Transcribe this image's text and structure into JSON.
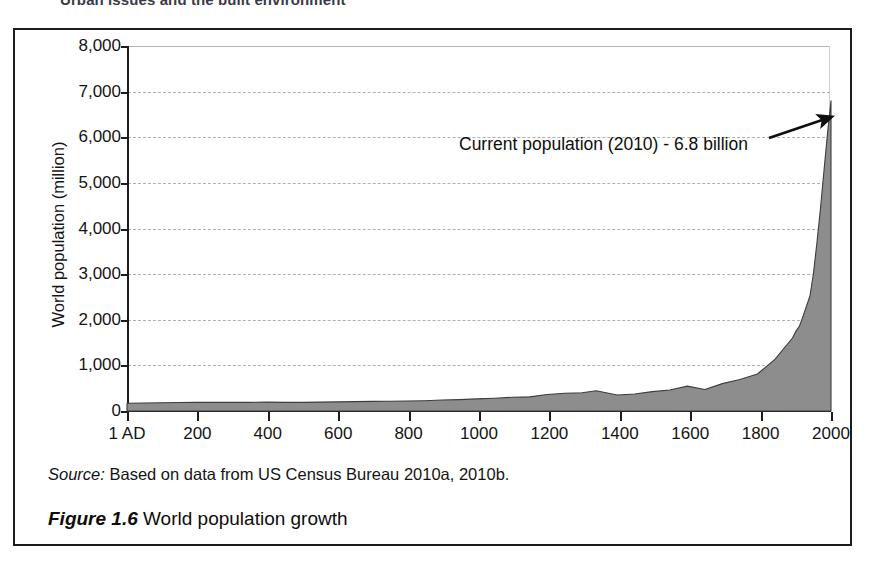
{
  "running_head": "Urban issues and the built environment",
  "figure": {
    "caption_number": "Figure 1.6",
    "caption_text": "World population growth",
    "source_lead": "Source:",
    "source_text": "Based on data from US Census Bureau 2010a, 2010b."
  },
  "annotation": {
    "text": "Current population (2010) - 6.8 billion"
  },
  "colors": {
    "area_fill": "#8d8d8d",
    "area_stroke": "#3d3d3d",
    "axis": "#1c1c1c",
    "grid": "#b0b0b0",
    "frame": "#1c1c1c",
    "text": "#141414"
  },
  "chart_data": {
    "type": "area",
    "title": "World population growth",
    "xlabel": "",
    "ylabel": "World population (million)",
    "xlim": [
      1,
      2010
    ],
    "ylim": [
      0,
      8000
    ],
    "grid": true,
    "legend": "none",
    "ytick_labels": [
      "8,000",
      "7,000",
      "6,000",
      "5,000",
      "4,000",
      "3,000",
      "2,000",
      "1,000",
      "0"
    ],
    "ytick_values": [
      8000,
      7000,
      6000,
      5000,
      4000,
      3000,
      2000,
      1000,
      0
    ],
    "xtick_labels": [
      "1 AD",
      "200",
      "400",
      "600",
      "800",
      "1000",
      "1200",
      "1400",
      "1600",
      "1800",
      "2000"
    ],
    "xtick_values": [
      1,
      200,
      400,
      600,
      800,
      1000,
      1200,
      1400,
      1600,
      1800,
      2000
    ],
    "annotations": [
      {
        "text": "Current population (2010) - 6.8 billion",
        "x": 2010,
        "y": 6800
      }
    ],
    "x": [
      1,
      50,
      100,
      150,
      200,
      250,
      300,
      350,
      400,
      450,
      500,
      550,
      600,
      650,
      700,
      750,
      800,
      850,
      900,
      950,
      1000,
      1050,
      1100,
      1150,
      1200,
      1250,
      1300,
      1340,
      1400,
      1450,
      1500,
      1550,
      1600,
      1650,
      1700,
      1750,
      1800,
      1850,
      1900,
      1910,
      1920,
      1930,
      1940,
      1950,
      1960,
      1970,
      1980,
      1990,
      2000,
      2010
    ],
    "values": [
      170,
      175,
      180,
      185,
      190,
      190,
      190,
      190,
      195,
      190,
      190,
      195,
      200,
      205,
      210,
      215,
      220,
      226,
      240,
      250,
      265,
      280,
      300,
      310,
      360,
      390,
      400,
      443,
      350,
      374,
      425,
      460,
      545,
      470,
      600,
      690,
      810,
      1130,
      1600,
      1750,
      1860,
      2070,
      2300,
      2520,
      3020,
      3700,
      4440,
      5270,
      6080,
      6800
    ]
  }
}
